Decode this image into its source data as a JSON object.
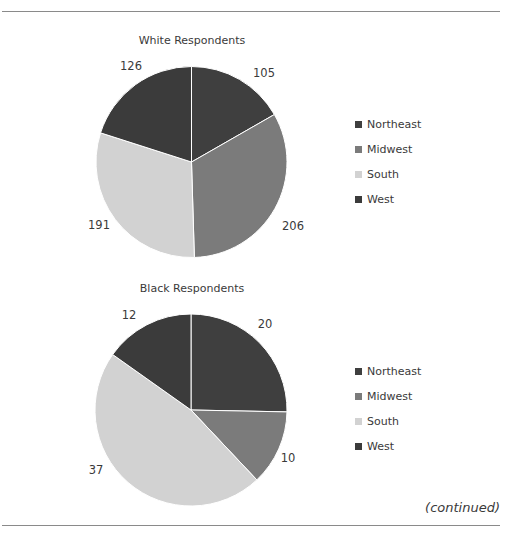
{
  "colors": {
    "Northeast": "#3f3f3f",
    "Midwest": "#7b7b7b",
    "South": "#d2d2d2",
    "West": "#3b3b3b",
    "rule": "#8a8a8a"
  },
  "footer": {
    "continued_label": "(continued)"
  },
  "chart_data": [
    {
      "type": "pie",
      "title": "White Respondents",
      "categories": [
        "Northeast",
        "Midwest",
        "South",
        "West"
      ],
      "values": [
        105,
        206,
        191,
        126
      ],
      "data_labels": [
        "105",
        "206",
        "191",
        "126"
      ],
      "start_angle": "12 o'clock, clockwise",
      "legend": {
        "position": "right",
        "entries": [
          "Northeast",
          "Midwest",
          "South",
          "West"
        ]
      }
    },
    {
      "type": "pie",
      "title": "Black Respondents",
      "categories": [
        "Northeast",
        "Midwest",
        "South",
        "West"
      ],
      "values": [
        20,
        10,
        37,
        12
      ],
      "data_labels": [
        "20",
        "10",
        "37",
        "12"
      ],
      "start_angle": "12 o'clock, clockwise",
      "legend": {
        "position": "right",
        "entries": [
          "Northeast",
          "Midwest",
          "South",
          "West"
        ]
      }
    }
  ]
}
